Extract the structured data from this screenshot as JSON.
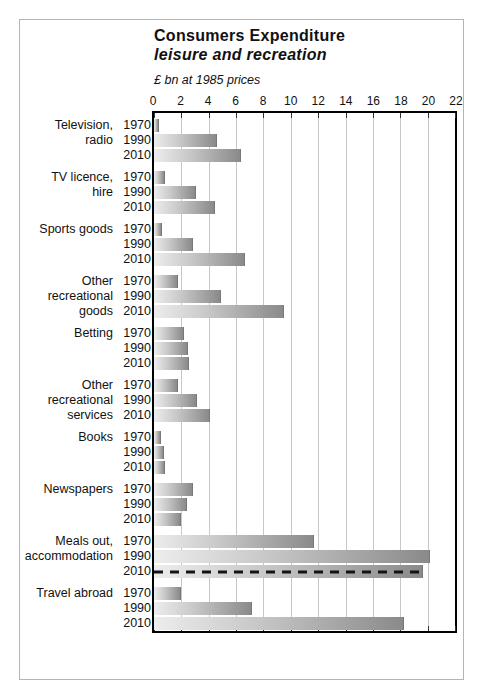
{
  "chart_data": {
    "type": "bar",
    "orientation": "horizontal",
    "title": "Consumers Expenditure",
    "subtitle": "leisure and recreation",
    "units_label": "£ bn at 1985 prices",
    "x_axis": {
      "min": 0,
      "max": 22,
      "tick_interval": 2,
      "ticks": [
        "0",
        "2",
        "4",
        "6",
        "8",
        "10",
        "12",
        "14",
        "16",
        "18",
        "20",
        "22"
      ],
      "position": "top",
      "grid": true
    },
    "years": [
      "1970",
      "1990",
      "2010"
    ],
    "categories": [
      {
        "label": "Television, radio",
        "label_lines": [
          "Television,",
          "radio"
        ],
        "values": [
          0.4,
          4.6,
          6.4
        ]
      },
      {
        "label": "TV licence, hire",
        "label_lines": [
          "TV licence,",
          "hire"
        ],
        "values": [
          0.8,
          3.1,
          4.5
        ]
      },
      {
        "label": "Sports goods",
        "label_lines": [
          "Sports goods"
        ],
        "values": [
          0.6,
          2.9,
          6.7
        ]
      },
      {
        "label": "Other recreational goods",
        "label_lines": [
          "Other",
          "recreational",
          "goods"
        ],
        "values": [
          1.8,
          4.9,
          9.6
        ]
      },
      {
        "label": "Betting",
        "label_lines": [
          "Betting"
        ],
        "values": [
          2.2,
          2.5,
          2.6
        ]
      },
      {
        "label": "Other recreational services",
        "label_lines": [
          "Other",
          "recreational",
          "services"
        ],
        "values": [
          1.8,
          3.2,
          4.1
        ]
      },
      {
        "label": "Books",
        "label_lines": [
          "Books"
        ],
        "values": [
          0.5,
          0.7,
          0.8
        ]
      },
      {
        "label": "Newspapers",
        "label_lines": [
          "Newspapers"
        ],
        "values": [
          2.9,
          2.4,
          2.0
        ]
      },
      {
        "label": "Meals out, accommodation",
        "label_lines": [
          "Meals out,",
          "accommodation"
        ],
        "values": [
          11.8,
          20.3,
          19.8
        ]
      },
      {
        "label": "Travel abroad",
        "label_lines": [
          "Travel abroad"
        ],
        "values": [
          2.0,
          7.2,
          18.4
        ]
      }
    ],
    "dashed_line": {
      "category": "Meals out, accommodation",
      "year": "2010",
      "color": "#141414"
    },
    "colors": {
      "bar_gradient_from": "#ededed",
      "bar_gradient_to": "#8a8a8a",
      "plot_border": "#000000",
      "gridline": "#c7c7c7",
      "page_frame": "#b4b4b4",
      "text": "#111111"
    },
    "legend": "none"
  }
}
